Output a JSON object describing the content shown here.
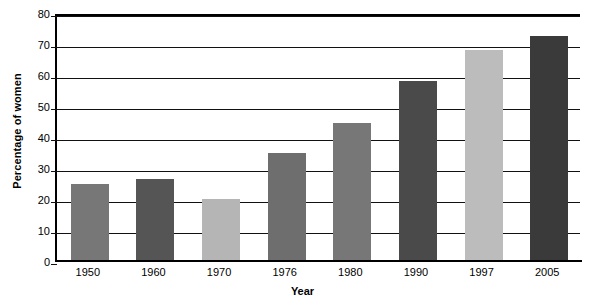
{
  "chart_data": {
    "type": "bar",
    "title": "",
    "xlabel": "Year",
    "ylabel": "Percentage of women",
    "categories": [
      "1950",
      "1960",
      "1970",
      "1976",
      "1980",
      "1990",
      "1997",
      "2005"
    ],
    "values": [
      25,
      26.5,
      20,
      35,
      44.5,
      58,
      68,
      72.5
    ],
    "bar_colors": [
      "#777777",
      "#555555",
      "#b5b5b5",
      "#6e6e6e",
      "#777777",
      "#4a4a4a",
      "#bcbcbc",
      "#3a3a3a"
    ],
    "ylim": [
      0,
      80
    ],
    "yticks": [
      0,
      10,
      20,
      30,
      40,
      50,
      60,
      70,
      80
    ],
    "ytick_labels": [
      "0",
      "10",
      "20",
      "30",
      "40",
      "50",
      "60",
      "70",
      "80"
    ],
    "grid": true,
    "legend": "none",
    "background_color": "#ffffff",
    "axis_color": "#000000"
  }
}
